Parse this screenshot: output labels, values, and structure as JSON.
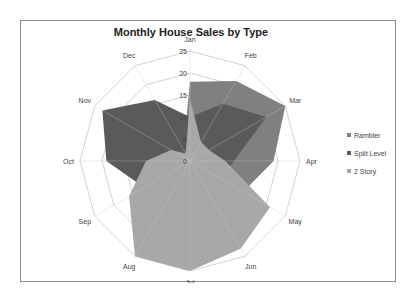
{
  "chart_data": {
    "type": "radar",
    "title": "Monthly House Sales by Type",
    "categories": [
      "Jan",
      "Feb",
      "Mar",
      "Apr",
      "May",
      "Jun",
      "Jul",
      "Aug",
      "Sep",
      "Oct",
      "Nov",
      "Dec"
    ],
    "rlim": [
      0,
      25
    ],
    "rticks": [
      "0",
      "5",
      "10",
      "15",
      "20",
      "25"
    ],
    "rtick_values": [
      0,
      5,
      10,
      15,
      20,
      25
    ],
    "grid": true,
    "legend_position": "right",
    "series": [
      {
        "name": "Rambler",
        "color": "#808080",
        "values": [
          18,
          21,
          25,
          19,
          14,
          10,
          5,
          2,
          2,
          2,
          2,
          3
        ]
      },
      {
        "name": "Split Level",
        "color": "#5a5a5a",
        "values": [
          10,
          15,
          20,
          10,
          8,
          5,
          3,
          5,
          12,
          19,
          23,
          16
        ]
      },
      {
        "name": "2 Story",
        "color": "#a8a8a8",
        "values": [
          14,
          5,
          5,
          8,
          21,
          23,
          25,
          25,
          16,
          10,
          5,
          2
        ]
      }
    ]
  }
}
